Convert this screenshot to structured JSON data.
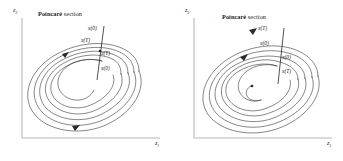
{
  "figure": {
    "background": "#ffffff",
    "curve_color": "#3a3a3a",
    "axis_color": "#b8b8b8",
    "text_color": "#1a1a1a"
  },
  "panels": [
    {
      "id": "left",
      "name": "unstable-limit-cycle-panel",
      "title": {
        "main": "Poincaré",
        "rest": " section"
      },
      "axes": {
        "y_label": "z",
        "y_sub": "2",
        "x_label": "z",
        "x_sub": "1"
      },
      "section_line": {
        "name": "poincare-section-line"
      },
      "labels": [
        {
          "name": "state-label-x0-outer",
          "text": "x(0)",
          "x": 88,
          "y": 27
        },
        {
          "name": "state-label-xT-outer",
          "text": "x(T)",
          "x": 83,
          "y": 39
        },
        {
          "name": "state-label-xT-inner",
          "text": "x(T)",
          "x": 99,
          "y": 53
        },
        {
          "name": "state-label-x0-inner",
          "text": "x(0)",
          "x": 99,
          "y": 68
        }
      ],
      "spiral": "outward",
      "markers": [
        "arrowhead-upper-left",
        "arrowhead-lower-left"
      ]
    },
    {
      "id": "right",
      "name": "stable-limit-cycle-panel",
      "title": {
        "main": "Poincaré",
        "rest": " section"
      },
      "axes": {
        "y_label": "z",
        "y_sub": "2",
        "x_label": "z",
        "x_sub": "1"
      },
      "section_line": {
        "name": "poincare-section-line"
      },
      "labels": [
        {
          "name": "state-label-xT-outer",
          "text": "x(T)",
          "x": 84,
          "y": 31
        },
        {
          "name": "state-label-x0-outer",
          "text": "x(0)",
          "x": 87,
          "y": 45
        },
        {
          "name": "state-label-x0-inner",
          "text": "x(0)",
          "x": 133,
          "y": 58
        },
        {
          "name": "state-label-xT-inner",
          "text": "x(T)",
          "x": 133,
          "y": 72
        }
      ],
      "spiral": "inward",
      "markers": [
        "arrowhead-upper-left",
        "center-dot"
      ]
    }
  ]
}
